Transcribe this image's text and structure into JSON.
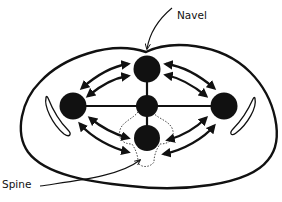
{
  "diagram": {
    "labels": {
      "navel": "Navel",
      "spine": "Spine"
    },
    "nodes": [
      {
        "id": "top",
        "role": "front node near navel"
      },
      {
        "id": "left",
        "role": "left side node"
      },
      {
        "id": "center",
        "role": "central node"
      },
      {
        "id": "right",
        "role": "right side node"
      },
      {
        "id": "bottom",
        "role": "rear node near spine"
      }
    ],
    "connections": [
      {
        "from": "left",
        "to": "right",
        "type": "line"
      },
      {
        "from": "top",
        "to": "bottom",
        "type": "line"
      }
    ],
    "arrows": [
      {
        "between": [
          "left",
          "top"
        ],
        "direction": "bidirectional",
        "position": "outer"
      },
      {
        "between": [
          "left",
          "top"
        ],
        "direction": "bidirectional",
        "position": "inner"
      },
      {
        "between": [
          "top",
          "right"
        ],
        "direction": "bidirectional",
        "position": "outer"
      },
      {
        "between": [
          "top",
          "right"
        ],
        "direction": "bidirectional",
        "position": "inner"
      },
      {
        "between": [
          "left",
          "bottom"
        ],
        "direction": "bidirectional",
        "position": "outer"
      },
      {
        "between": [
          "left",
          "bottom"
        ],
        "direction": "bidirectional",
        "position": "inner"
      },
      {
        "between": [
          "right",
          "bottom"
        ],
        "direction": "bidirectional",
        "position": "inner"
      },
      {
        "between": [
          "right",
          "bottom"
        ],
        "direction": "bidirectional",
        "position": "outer"
      }
    ],
    "colors": {
      "stroke": "#111111",
      "fill": "#111111",
      "background": "#ffffff"
    }
  }
}
